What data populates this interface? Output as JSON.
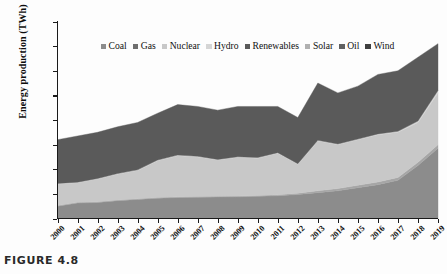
{
  "figure": {
    "caption": "FIGURE 4.8"
  },
  "chart_data": {
    "type": "area",
    "stacked": true,
    "title": "",
    "subtitle": "",
    "xlabel": "",
    "ylabel": "Energy production (TWh)",
    "ylim": [
      0,
      160
    ],
    "ytick_labels": [
      "160",
      "140",
      "120",
      "100",
      "80",
      "60",
      "40",
      "20",
      "0"
    ],
    "ytick_values": [
      160,
      140,
      120,
      100,
      80,
      60,
      40,
      20,
      0
    ],
    "grid": false,
    "legend_position": "top-center",
    "categories": [
      "2000",
      "2001",
      "2002",
      "2003",
      "2004",
      "2005",
      "2006",
      "2007",
      "2008",
      "2009",
      "2010",
      "2011",
      "2012",
      "2013",
      "2014",
      "2015",
      "2016",
      "2017",
      "2018",
      "2019"
    ],
    "series": [
      {
        "name": "Coal",
        "color": "#8c8c8c",
        "values": [
          10.0,
          12.5,
          13.0,
          14.5,
          15.5,
          16.5,
          17.0,
          17.3,
          17.5,
          17.6,
          18.0,
          18.5,
          19.5,
          21.0,
          22.5,
          25.0,
          27.5,
          31.0,
          43.0,
          57.0
        ]
      },
      {
        "name": "Gas",
        "color": "#a6a6a6",
        "values": [
          0.6,
          0.6,
          0.6,
          0.6,
          0.6,
          0.6,
          0.6,
          0.6,
          0.6,
          0.6,
          0.7,
          0.8,
          1.0,
          1.5,
          1.8,
          2.0,
          2.2,
          2.4,
          2.6,
          3.0
        ]
      },
      {
        "name": "Nuclear",
        "color": "#c8c8c8",
        "values": [
          17.4,
          15.9,
          18.4,
          20.9,
          22.9,
          29.9,
          33.4,
          32.1,
          29.4,
          31.4,
          30.3,
          33.7,
          23.5,
          40.5,
          35.7,
          37.0,
          38.4,
          36.6,
          32.4,
          42.0
        ]
      },
      {
        "name": "Hydro",
        "color": "#d5d5d5",
        "values": [
          0.5,
          0.5,
          0.5,
          0.5,
          0.5,
          0.5,
          0.5,
          0.5,
          0.5,
          0.5,
          0.5,
          0.5,
          0.5,
          0.5,
          0.5,
          0.5,
          0.6,
          0.8,
          1.2,
          2.0
        ]
      },
      {
        "name": "Renewables",
        "color": "#5a5a5a",
        "values": [
          35.5,
          37.5,
          37.5,
          38.0,
          38.5,
          38.0,
          41.0,
          40.5,
          40.0,
          40.9,
          41.5,
          37.5,
          37.5,
          46.5,
          41.5,
          43.0,
          48.3,
          49.2,
          51.8,
          38.0
        ]
      },
      {
        "name": "Solar",
        "color": "#b0b0b0",
        "values": [
          0,
          0,
          0,
          0,
          0,
          0,
          0,
          0,
          0,
          0,
          0,
          0,
          0,
          0,
          0,
          0,
          0,
          0,
          0,
          0
        ]
      },
      {
        "name": "Oil",
        "color": "#707070",
        "values": [
          0,
          0,
          0,
          0,
          0,
          0,
          0,
          0,
          0,
          0,
          0,
          0,
          0,
          0,
          0,
          0,
          0,
          0,
          0,
          0
        ]
      },
      {
        "name": "Wind",
        "color": "#4a4a4a",
        "values": [
          0,
          0,
          0,
          0,
          0,
          0,
          0,
          0,
          0,
          0,
          0,
          0,
          0,
          0,
          0,
          0,
          0,
          0,
          0,
          0
        ]
      }
    ],
    "totals": [
      64.0,
      67.0,
      70.0,
      74.5,
      78.0,
      85.5,
      92.5,
      91.0,
      88.0,
      91.0,
      91.0,
      91.0,
      82.0,
      110.0,
      102.0,
      107.5,
      117.0,
      120.0,
      131.0,
      142.0
    ]
  },
  "legend": {
    "items": [
      {
        "label": "Coal",
        "color": "#8c8c8c"
      },
      {
        "label": "Gas",
        "color": "#6e6e6e"
      },
      {
        "label": "Nuclear",
        "color": "#c8c8c8"
      },
      {
        "label": "Hydro",
        "color": "#d5d5d5"
      },
      {
        "label": "Renewables",
        "color": "#5a5a5a"
      },
      {
        "label": "Solar",
        "color": "#b0b0b0"
      },
      {
        "label": "Oil",
        "color": "#606060"
      },
      {
        "label": "Wind",
        "color": "#3f3f3f"
      }
    ]
  }
}
